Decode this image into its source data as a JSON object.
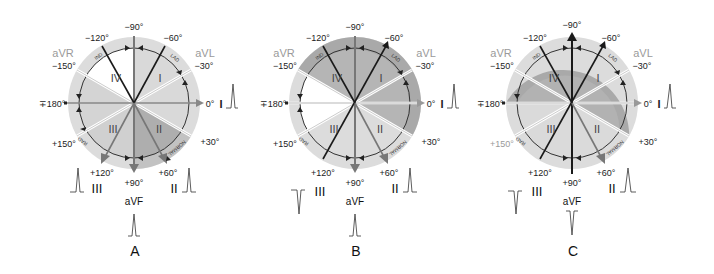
{
  "figure": {
    "colors": {
      "outer_ring": "#dcdcdc",
      "light_fill": "#d9d9d9",
      "medium_fill": "#b8b8b8",
      "dark_fill": "#a8a8a8",
      "white": "#ffffff",
      "line_dark": "#1a1a1a",
      "line_gray": "#7a7a7a",
      "label_gray": "#9a9a9a"
    },
    "degree_labels": {
      "m90": "−90°",
      "m60": "−60°",
      "m120": "−120°",
      "m30": "−30°",
      "m150": "−150°",
      "p180": "∓180°",
      "zero": "0°",
      "p30": "+30°",
      "p60": "+60°",
      "p90": "+90°",
      "p120": "+120°",
      "p150": "+150°"
    },
    "lead_labels": {
      "aVR": "aVR",
      "aVL": "aVL",
      "I": "I",
      "II": "II",
      "III": "III",
      "aVF": "aVF"
    },
    "sector_labels": {
      "q1": "I",
      "q2": "II",
      "q3": "III",
      "q4": "IV"
    },
    "arc_labels": {
      "ind": "IND",
      "lad": "LAD",
      "rad": "RAD",
      "normal": "NORMAL"
    },
    "panels": [
      {
        "id": "A",
        "label": "A",
        "axis_deg": 60,
        "waveforms": {
          "I": "up",
          "II": "up",
          "III": "up",
          "aVF": "up"
        },
        "shading": "normal-axis"
      },
      {
        "id": "B",
        "label": "B",
        "axis_deg": -60,
        "waveforms": {
          "I": "up",
          "II": "up",
          "III": "down",
          "aVF": "up"
        },
        "shading": "left-axis-deviation"
      },
      {
        "id": "C",
        "label": "C",
        "axis_deg": -90,
        "waveforms": {
          "I": "up",
          "II": "up",
          "III": "down",
          "aVF": "down"
        },
        "shading": "extreme-left"
      }
    ]
  }
}
